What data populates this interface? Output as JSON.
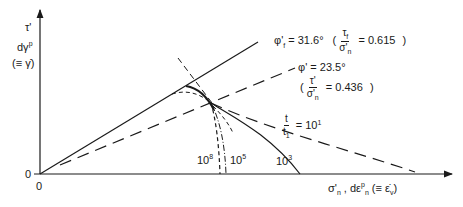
{
  "diagram": {
    "y_axis": {
      "label_line1": "τ'",
      "label_line2": "dγ",
      "label_line2_sup": "p",
      "label_line3": "(≡ γ̇)",
      "origin_label": "0"
    },
    "x_axis": {
      "label_main": "σ'",
      "label_main_sub": "n",
      "label_sep": " , dε",
      "label_sep_sup": "p",
      "label_sep_sub": "n",
      "label_eq": " (≡ ε̇",
      "label_eq_sub": "v",
      "label_close": ")",
      "origin_label": "0"
    },
    "lines": {
      "failure_line": {
        "label_phi": "φ'",
        "label_phi_sub": "f",
        "label_value": " = 31.6°",
        "ratio_num": "τ",
        "ratio_num_sub": "f",
        "ratio_den": "σ'",
        "ratio_den_sub": "n",
        "ratio_value": "= 0.615",
        "open_paren": "(",
        "close_paren": ")"
      },
      "mobilised_line": {
        "label_phi": "φ'",
        "label_value": " = 23.5°",
        "ratio_num": "τ'",
        "ratio_den": "σ'",
        "ratio_den_sub": "n",
        "ratio_value": "= 0.436",
        "open_paren": "(",
        "close_paren": ")"
      }
    },
    "curves": {
      "time_ratio_num": "t",
      "time_ratio_den": "t",
      "time_ratio_den_sub": "1",
      "time_ratio_eq": "= 10",
      "t1_exp": "1",
      "t3_base": "10",
      "t3_exp": "3",
      "t5_base": "10",
      "t5_exp": "5",
      "t8_base": "10",
      "t8_exp": "8"
    },
    "colors": {
      "ink": "#1a1a1a",
      "background": "#ffffff"
    }
  }
}
